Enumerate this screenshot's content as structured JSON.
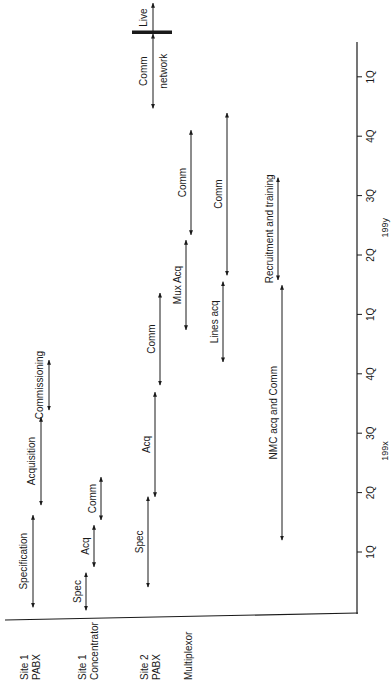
{
  "chart_data": {
    "type": "gantt",
    "orientation": "rotated-90-ccw",
    "title": "",
    "time_unit": "quarter",
    "time_origin_note": "t=0 is the 1Q tick of 199x; each quarter tick is +1",
    "axis": {
      "range": [
        -1.0,
        8.6
      ],
      "ticks": [
        {
          "t": 0,
          "label": "1Q"
        },
        {
          "t": 1,
          "label": "2Q"
        },
        {
          "t": 2,
          "label": "3Q"
        },
        {
          "t": 3,
          "label": "4Q"
        },
        {
          "t": 4,
          "label": "1Q"
        },
        {
          "t": 5,
          "label": "2Q"
        },
        {
          "t": 6,
          "label": "3Q"
        },
        {
          "t": 7,
          "label": "4Q"
        },
        {
          "t": 8,
          "label": "1Q"
        }
      ],
      "year_labels": [
        {
          "t": 1.7,
          "label": "199x"
        },
        {
          "t": 5.46,
          "label": "199y"
        }
      ]
    },
    "rows": [
      {
        "id": "site1-pabx",
        "label_lines": [
          "Site 1",
          "PABX"
        ]
      },
      {
        "id": "site1-concentrator",
        "label_lines": [
          "Site 1",
          "Concentrator"
        ]
      },
      {
        "id": "site2-pabx",
        "label_lines": [
          "Site 2",
          "PABX"
        ]
      },
      {
        "id": "multiplexor",
        "label_lines": [
          "Multiplexor"
        ]
      }
    ],
    "tasks": [
      {
        "row": "site1-pabx",
        "label": "Specification",
        "start": -0.93,
        "end": 0.62,
        "lane": 0
      },
      {
        "row": "site1-pabx",
        "label": "Acquisition",
        "start": 0.79,
        "end": 2.27,
        "lane": 1
      },
      {
        "row": "site1-pabx",
        "label": "Commissioning",
        "start": 2.39,
        "end": 3.23,
        "lane": 2
      },
      {
        "row": "site1-concentrator",
        "label": "Spec",
        "start": -0.98,
        "end": -0.35,
        "lane": 3
      },
      {
        "row": "site1-concentrator",
        "label": "Acq",
        "start": -0.25,
        "end": 0.45,
        "lane": 4
      },
      {
        "row": "site1-concentrator",
        "label": "Comm",
        "start": 0.54,
        "end": 1.26,
        "lane": 5
      },
      {
        "row": "site2-pabx",
        "label": "Spec",
        "start": -0.59,
        "end": 0.93,
        "lane": 6
      },
      {
        "row": "site2-pabx",
        "label": "Acq",
        "start": 0.93,
        "end": 2.69,
        "lane": 7
      },
      {
        "row": "site2-pabx",
        "label": "Comm",
        "start": 2.81,
        "end": 4.36,
        "lane": 8
      },
      {
        "row": "multiplexor",
        "label": "Mux Acq",
        "start": 3.74,
        "end": 5.25,
        "lane": 9
      },
      {
        "row": "multiplexor",
        "label": "Comm",
        "start": 5.34,
        "end": 7.1,
        "lane": 10
      },
      {
        "row": "lines",
        "label": "Lines acq",
        "start": 3.2,
        "end": 4.55,
        "lane": 11
      },
      {
        "row": "lines",
        "label": "Comm",
        "start": 4.66,
        "end": 7.39,
        "lane": 12
      },
      {
        "row": "nmc",
        "label": "NMC acq and Comm",
        "start": 0.2,
        "end": 4.49,
        "lane": 13
      },
      {
        "row": "nmc",
        "label": "Recruitment and training",
        "start": 4.58,
        "end": 6.3,
        "lane": 14
      },
      {
        "row": "network",
        "label": "Comm",
        "sublabel": "network",
        "start": 7.47,
        "end": 8.72,
        "lane": 15
      }
    ],
    "milestone": {
      "label": "Live",
      "t": 8.75,
      "arrow_end": 9.24
    }
  }
}
